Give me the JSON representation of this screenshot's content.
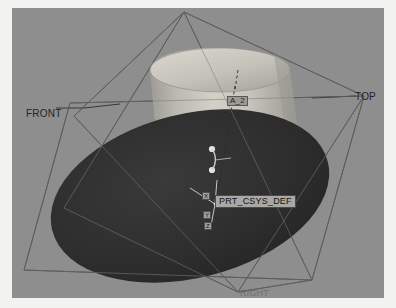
{
  "window": {
    "app": "3D CAD Model Viewer",
    "background_color": "#8e8e8e",
    "page_background": "#f2f2f0"
  },
  "viewport": {
    "width": 372,
    "height": 290,
    "shading": "shaded-with-datums"
  },
  "datum_planes": [
    {
      "name": "FRONT",
      "label": "FRONT",
      "color": "#2b2b2b"
    },
    {
      "name": "TOP",
      "label": "TOP",
      "color": "#2b2b2b"
    },
    {
      "name": "RIGHT",
      "label": "RIGHT",
      "color": "#5a5a5a"
    }
  ],
  "datum_axes": [
    {
      "name": "A_2",
      "label": "A_2"
    }
  ],
  "coordinate_system": {
    "label": "PRT_CSYS_DEF",
    "axis_labels": {
      "x": "X",
      "y": "Y",
      "z": "Z"
    },
    "origin": {
      "x": 203,
      "y": 196
    }
  },
  "model": {
    "solids": [
      {
        "name": "cylinder-boss",
        "type": "cylinder",
        "fill_light": "#c8c6bd",
        "fill_dark": "#9c9a92"
      },
      {
        "name": "base-disk",
        "type": "ellipse-disk",
        "fill": "#2e2e2e"
      }
    ]
  },
  "colors": {
    "viewport_bg": "#8e8e8e",
    "datum_line": "#2f2f2f",
    "solid_highlight": "#d4d2c9",
    "solid_shadow": "#8c8a82",
    "dark_solid": "#2e2e2e",
    "label_text": "#1d1d1d"
  }
}
